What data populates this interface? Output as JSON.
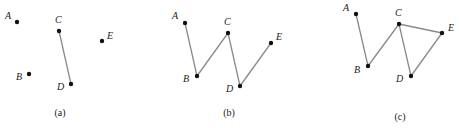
{
  "panels": [
    {
      "caption": "(a)",
      "caption_pos": [
        60,
        116
      ],
      "vertices": [
        {
          "id": "A",
          "label": "A",
          "pos": [
            17,
            22
          ],
          "label_pos": [
            5,
            19
          ]
        },
        {
          "id": "B",
          "label": "B",
          "pos": [
            29,
            74
          ],
          "label_pos": [
            16,
            80
          ]
        },
        {
          "id": "C",
          "label": "C",
          "pos": [
            59,
            31
          ],
          "label_pos": [
            55,
            23
          ]
        },
        {
          "id": "D",
          "label": "D",
          "pos": [
            71,
            84
          ],
          "label_pos": [
            57,
            90
          ]
        },
        {
          "id": "E",
          "label": "E",
          "pos": [
            102,
            41
          ],
          "label_pos": [
            107,
            39
          ]
        }
      ],
      "edges": [
        [
          "C",
          "D"
        ]
      ]
    },
    {
      "caption": "(b)",
      "caption_pos": [
        229,
        116
      ],
      "vertices": [
        {
          "id": "A",
          "label": "A",
          "pos": [
            185,
            23
          ],
          "label_pos": [
            172,
            19
          ]
        },
        {
          "id": "B",
          "label": "B",
          "pos": [
            197,
            76
          ],
          "label_pos": [
            183,
            82
          ]
        },
        {
          "id": "C",
          "label": "C",
          "pos": [
            228,
            33
          ],
          "label_pos": [
            224,
            25
          ]
        },
        {
          "id": "D",
          "label": "D",
          "pos": [
            240,
            86
          ],
          "label_pos": [
            226,
            92
          ]
        },
        {
          "id": "E",
          "label": "E",
          "pos": [
            271,
            43
          ],
          "label_pos": [
            276,
            40
          ]
        }
      ],
      "edges": [
        [
          "A",
          "B"
        ],
        [
          "B",
          "C"
        ],
        [
          "C",
          "D"
        ],
        [
          "D",
          "E"
        ]
      ]
    },
    {
      "caption": "(c)",
      "caption_pos": [
        400,
        120
      ],
      "vertices": [
        {
          "id": "A",
          "label": "A",
          "pos": [
            356,
            14
          ],
          "label_pos": [
            343,
            11
          ]
        },
        {
          "id": "B",
          "label": "B",
          "pos": [
            368,
            66
          ],
          "label_pos": [
            354,
            73
          ]
        },
        {
          "id": "C",
          "label": "C",
          "pos": [
            399,
            24
          ],
          "label_pos": [
            395,
            16
          ]
        },
        {
          "id": "D",
          "label": "D",
          "pos": [
            411,
            76
          ],
          "label_pos": [
            396,
            82
          ]
        },
        {
          "id": "E",
          "label": "E",
          "pos": [
            442,
            33
          ],
          "label_pos": [
            448,
            31
          ]
        }
      ],
      "edges": [
        [
          "A",
          "B"
        ],
        [
          "B",
          "C"
        ],
        [
          "C",
          "D"
        ],
        [
          "C",
          "E"
        ],
        [
          "D",
          "E"
        ]
      ]
    }
  ],
  "colors": {
    "edge": "#8a8a8a",
    "vertex": "#111111",
    "text": "#222222"
  }
}
